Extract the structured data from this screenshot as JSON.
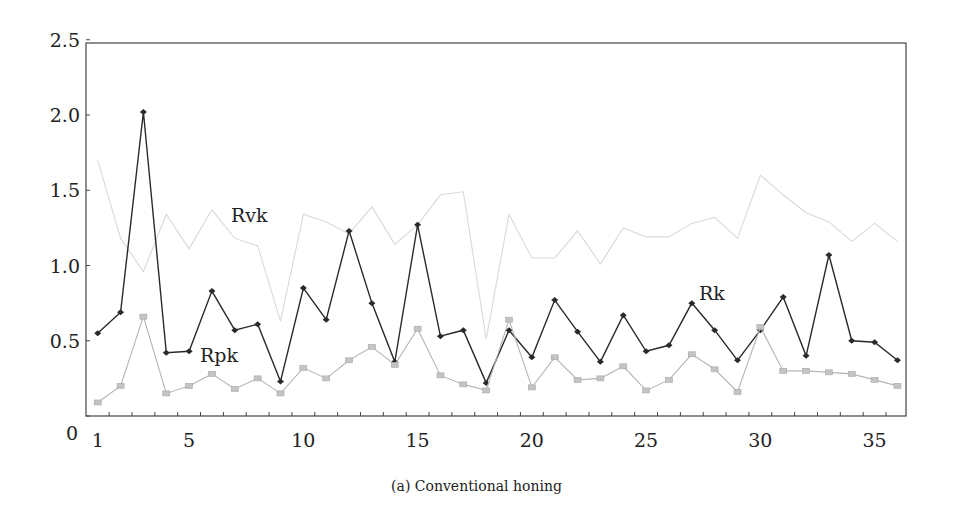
{
  "chart_data": {
    "type": "line",
    "title": "",
    "caption": "(a) Conventional honing",
    "xlabel": "",
    "ylabel": "",
    "xlim": [
      0.5,
      36.5
    ],
    "ylim": [
      0,
      2.5
    ],
    "x_ticks": [
      1,
      5,
      10,
      15,
      20,
      25,
      30,
      35
    ],
    "y_ticks": [
      0,
      0.5,
      1.0,
      1.5,
      2.0,
      2.5
    ],
    "y_tick_labels": [
      "0",
      "0.5",
      "1.0",
      "1.5",
      "2.0",
      "2.5"
    ],
    "grid": false,
    "legend": "inline labels",
    "x": [
      1,
      2,
      3,
      4,
      5,
      6,
      7,
      8,
      9,
      10,
      11,
      12,
      13,
      14,
      15,
      16,
      17,
      18,
      19,
      20,
      21,
      22,
      23,
      24,
      25,
      26,
      27,
      28,
      29,
      30,
      31,
      32,
      33,
      34,
      35,
      36
    ],
    "series": [
      {
        "name": "Rvk",
        "color": "#d9d9d9",
        "marker": "none",
        "label_pos": [
          231,
          222
        ],
        "values": [
          1.7,
          1.18,
          0.96,
          1.34,
          1.11,
          1.37,
          1.18,
          1.13,
          0.63,
          1.34,
          1.29,
          1.21,
          1.39,
          1.14,
          1.27,
          1.47,
          1.49,
          0.51,
          1.34,
          1.05,
          1.05,
          1.23,
          1.01,
          1.25,
          1.19,
          1.19,
          1.28,
          1.32,
          1.18,
          1.6,
          1.47,
          1.35,
          1.29,
          1.16,
          1.28,
          1.16
        ]
      },
      {
        "name": "Rk",
        "color": "#2a2a2a",
        "marker": "diamond",
        "label_pos": [
          699,
          300
        ],
        "values": [
          0.55,
          0.69,
          2.02,
          0.42,
          0.43,
          0.83,
          0.57,
          0.61,
          0.23,
          0.85,
          0.64,
          1.23,
          0.75,
          0.36,
          1.27,
          0.53,
          0.57,
          0.22,
          0.57,
          0.39,
          0.77,
          0.56,
          0.36,
          0.67,
          0.43,
          0.47,
          0.75,
          0.57,
          0.37,
          0.57,
          0.79,
          0.4,
          1.07,
          0.5,
          0.49,
          0.37
        ]
      },
      {
        "name": "Rpk",
        "color": "#b5b5b5",
        "marker": "square",
        "label_pos": [
          200,
          362
        ],
        "values": [
          0.09,
          0.2,
          0.66,
          0.15,
          0.2,
          0.28,
          0.18,
          0.25,
          0.15,
          0.32,
          0.25,
          0.37,
          0.46,
          0.34,
          0.58,
          0.27,
          0.21,
          0.17,
          0.64,
          0.19,
          0.39,
          0.24,
          0.25,
          0.33,
          0.17,
          0.24,
          0.41,
          0.31,
          0.16,
          0.59,
          0.3,
          0.3,
          0.29,
          0.28,
          0.24,
          0.2
        ]
      }
    ]
  }
}
